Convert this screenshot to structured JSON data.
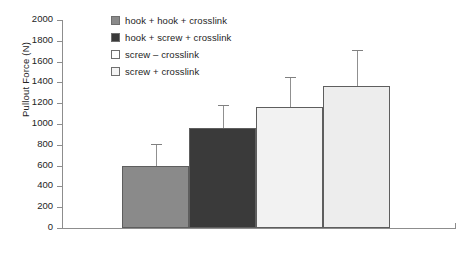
{
  "chart_data": {
    "type": "bar",
    "title": "",
    "xlabel": "",
    "ylabel": "Pullout Force (N)",
    "ylim": [
      0,
      2000
    ],
    "ytick_step": 200,
    "yticks": [
      2000,
      1800,
      1600,
      1400,
      1200,
      1000,
      800,
      600,
      400,
      200,
      0
    ],
    "grid": false,
    "legend_position": "top-left-inside",
    "xtick_labels_shown": false,
    "categories": [
      "hook + hook + crosslink",
      "hook + screw + crosslink",
      "screw – crosslink",
      "screw + crosslink"
    ],
    "values": [
      595,
      960,
      1165,
      1365
    ],
    "error_upper": [
      810,
      1180,
      1455,
      1715
    ],
    "error_bars": [
      215,
      220,
      290,
      350
    ],
    "series": [
      {
        "name": "Pullout Force (N)",
        "values": [
          595,
          960,
          1165,
          1365
        ]
      }
    ],
    "bar_colors": [
      "#8a8a8a",
      "#3a3a3a",
      "#f2f2f2",
      "#ededed"
    ],
    "bar_border_color": "#5e5e5e"
  },
  "legend": {
    "items": [
      {
        "label": "hook + hook + crosslink",
        "color": "#8a8a8a"
      },
      {
        "label": "hook + screw + crosslink",
        "color": "#3a3a3a"
      },
      {
        "label": "screw – crosslink",
        "color": "#ffffff"
      },
      {
        "label": "screw + crosslink",
        "color": "#f4f4f4"
      }
    ]
  },
  "axis": {
    "y_title": "Pullout Force (N)",
    "ticks": [
      "2000",
      "1800",
      "1600",
      "1400",
      "1200",
      "1000",
      "800",
      "600",
      "400",
      "200",
      "0"
    ]
  },
  "colors": {
    "axis_line": "#8d8d8d",
    "text": "#242424",
    "error_bar": "#909090"
  }
}
